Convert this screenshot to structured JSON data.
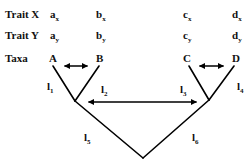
{
  "rows": {
    "trait_x": {
      "label": "Trait X",
      "values": [
        {
          "base": "a",
          "sub": "x"
        },
        {
          "base": "b",
          "sub": "x"
        },
        {
          "base": "c",
          "sub": "x"
        },
        {
          "base": "d",
          "sub": "x"
        }
      ]
    },
    "trait_y": {
      "label": "Trait Y",
      "values": [
        {
          "base": "a",
          "sub": "y"
        },
        {
          "base": "b",
          "sub": "y"
        },
        {
          "base": "c",
          "sub": "y"
        },
        {
          "base": "d",
          "sub": "y"
        }
      ]
    },
    "taxa": {
      "label": "Taxa",
      "values": [
        "A",
        "B",
        "C",
        "D"
      ]
    }
  },
  "branches": [
    {
      "base": "l",
      "sub": "1"
    },
    {
      "base": "l",
      "sub": "2"
    },
    {
      "base": "l",
      "sub": "3"
    },
    {
      "base": "l",
      "sub": "4"
    },
    {
      "base": "l",
      "sub": "5"
    },
    {
      "base": "l",
      "sub": "6"
    }
  ],
  "colors": {
    "line": "#000000",
    "text": "#111111",
    "background": "#ffffff"
  }
}
